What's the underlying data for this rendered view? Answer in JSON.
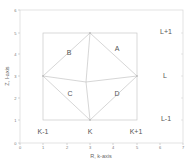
{
  "axes": {
    "x_label": "R, k-axis",
    "y_label": "Z, l-axis",
    "x_ticks": [
      "0",
      "1",
      "2",
      "3",
      "4",
      "5",
      "6",
      "7"
    ],
    "y_ticks": [
      "0",
      "1",
      "2",
      "3",
      "4",
      "5",
      "6"
    ],
    "x_range": [
      0,
      7
    ],
    "y_range": [
      0,
      6
    ]
  },
  "regions": {
    "A": "A",
    "B": "B",
    "C": "C",
    "D": "D"
  },
  "column_labels": {
    "k_minus_1": "K-1",
    "k": "K",
    "k_plus_1": "K+1"
  },
  "row_labels": {
    "l_plus_1": "L+1",
    "l": "L",
    "l_minus_1": "L-1"
  },
  "geometry": {
    "inner_square": {
      "x0": 1,
      "y0": 1,
      "x1": 5,
      "y1": 5
    },
    "diamond": {
      "top": [
        3,
        5
      ],
      "left": [
        1,
        3
      ],
      "right": [
        5,
        3
      ],
      "bottom": [
        3,
        1
      ],
      "center": [
        2.85,
        2.8
      ]
    }
  },
  "colors": {
    "line": "#c8c8c8",
    "frame": "#d0d0d0",
    "text": "#555555"
  }
}
